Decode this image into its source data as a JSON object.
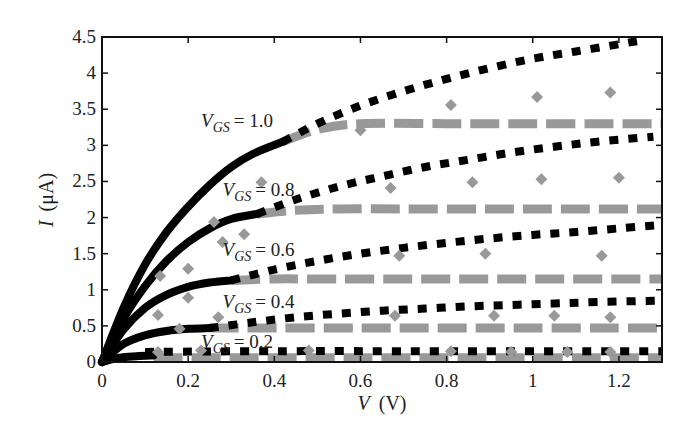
{
  "chart_data": {
    "type": "line",
    "title": "",
    "xlabel": "V (V)",
    "ylabel": "I (μA)",
    "xlim": [
      0,
      1.3
    ],
    "ylim": [
      0,
      4.5
    ],
    "xticks": [
      "0",
      "0.2",
      "0.4",
      "0.6",
      "0.8",
      "1",
      "1.2"
    ],
    "xtick_values": [
      0,
      0.2,
      0.4,
      0.6,
      0.8,
      1.0,
      1.2
    ],
    "yticks": [
      "0",
      "0.5",
      "1",
      "1.5",
      "2",
      "2.5",
      "3",
      "3.5",
      "4",
      "4.5"
    ],
    "ytick_values": [
      0,
      0.5,
      1,
      1.5,
      2,
      2.5,
      3,
      3.5,
      4,
      4.5
    ],
    "grid": false,
    "legend": "none (inline curve labels)",
    "series_styles": {
      "solid": {
        "color": "#000000",
        "description": "solid black line (linear/triode region)"
      },
      "dashed": {
        "color": "#999999",
        "description": "gray dashed line (saturation model)"
      },
      "dotted": {
        "color": "#000000",
        "description": "black square-dotted line (alternate model)"
      },
      "markers": {
        "color": "#999999",
        "description": "gray diamond markers (measured data)"
      }
    },
    "curves": [
      {
        "label_prefix": "V",
        "label_sub": "GS",
        "label_value": "= 1.0",
        "vgs": 1.0,
        "solid": {
          "x": [
            0,
            0.05,
            0.1,
            0.15,
            0.2,
            0.25,
            0.3,
            0.35,
            0.42
          ],
          "y": [
            0,
            0.75,
            1.35,
            1.8,
            2.15,
            2.45,
            2.7,
            2.88,
            3.05
          ]
        },
        "gray": {
          "x": [
            0.42,
            0.5,
            0.6,
            0.8,
            1.0,
            1.2,
            1.3
          ],
          "y": [
            3.05,
            3.22,
            3.3,
            3.3,
            3.3,
            3.3,
            3.3
          ]
        },
        "dotted": {
          "x": [
            0.42,
            0.5,
            0.6,
            0.7,
            0.8,
            0.9,
            1.0,
            1.1,
            1.2,
            1.25
          ],
          "y": [
            3.05,
            3.3,
            3.55,
            3.75,
            3.92,
            4.07,
            4.2,
            4.3,
            4.4,
            4.45
          ]
        },
        "markers": {
          "x": [
            0.6,
            0.81,
            1.01,
            1.18
          ],
          "y": [
            3.21,
            3.56,
            3.67,
            3.73
          ]
        }
      },
      {
        "label_prefix": "V",
        "label_sub": "GS",
        "label_value": "= 0.8",
        "vgs": 0.8,
        "solid": {
          "x": [
            0,
            0.05,
            0.1,
            0.15,
            0.2,
            0.25,
            0.3,
            0.36
          ],
          "y": [
            0,
            0.6,
            1.05,
            1.4,
            1.66,
            1.85,
            1.98,
            2.05
          ]
        },
        "gray": {
          "x": [
            0.36,
            0.45,
            0.55,
            0.7,
            0.9,
            1.1,
            1.3
          ],
          "y": [
            2.05,
            2.1,
            2.12,
            2.12,
            2.12,
            2.12,
            2.12
          ]
        },
        "dotted": {
          "x": [
            0.36,
            0.45,
            0.55,
            0.65,
            0.75,
            0.85,
            0.95,
            1.05,
            1.15,
            1.28
          ],
          "y": [
            2.05,
            2.25,
            2.43,
            2.57,
            2.7,
            2.8,
            2.9,
            2.98,
            3.05,
            3.12
          ]
        },
        "markers": {
          "x": [
            0.26,
            0.33,
            0.37,
            0.67,
            0.86,
            1.02,
            1.2
          ],
          "y": [
            1.94,
            1.77,
            2.49,
            2.41,
            2.49,
            2.53,
            2.55
          ]
        }
      },
      {
        "label_prefix": "V",
        "label_sub": "GS",
        "label_value": "= 0.6",
        "vgs": 0.6,
        "solid": {
          "x": [
            0,
            0.05,
            0.1,
            0.15,
            0.2,
            0.25,
            0.3
          ],
          "y": [
            0,
            0.45,
            0.75,
            0.93,
            1.04,
            1.1,
            1.13
          ]
        },
        "gray": {
          "x": [
            0.3,
            0.4,
            0.5,
            0.7,
            0.9,
            1.1,
            1.3
          ],
          "y": [
            1.13,
            1.15,
            1.15,
            1.15,
            1.15,
            1.15,
            1.15
          ]
        },
        "dotted": {
          "x": [
            0.3,
            0.4,
            0.5,
            0.6,
            0.7,
            0.8,
            0.9,
            1.0,
            1.1,
            1.2,
            1.3
          ],
          "y": [
            1.13,
            1.28,
            1.4,
            1.5,
            1.58,
            1.65,
            1.71,
            1.76,
            1.8,
            1.85,
            1.9
          ]
        },
        "markers": {
          "x": [
            0.135,
            0.2,
            0.28,
            0.69,
            0.89,
            1.16
          ],
          "y": [
            1.19,
            1.29,
            1.66,
            1.47,
            1.5,
            1.47
          ]
        }
      },
      {
        "label_prefix": "V",
        "label_sub": "GS",
        "label_value": "= 0.4",
        "vgs": 0.4,
        "solid": {
          "x": [
            0,
            0.05,
            0.1,
            0.15,
            0.2,
            0.25
          ],
          "y": [
            0,
            0.25,
            0.37,
            0.43,
            0.46,
            0.47
          ]
        },
        "gray": {
          "x": [
            0.25,
            0.4,
            0.6,
            0.8,
            1.0,
            1.2,
            1.3
          ],
          "y": [
            0.47,
            0.47,
            0.47,
            0.47,
            0.47,
            0.47,
            0.47
          ]
        },
        "dotted": {
          "x": [
            0.25,
            0.35,
            0.45,
            0.55,
            0.65,
            0.75,
            0.85,
            0.95,
            1.05,
            1.15,
            1.3
          ],
          "y": [
            0.47,
            0.55,
            0.62,
            0.67,
            0.71,
            0.74,
            0.77,
            0.79,
            0.81,
            0.83,
            0.85
          ]
        },
        "markers": {
          "x": [
            0.13,
            0.18,
            0.2,
            0.27,
            0.68,
            0.91,
            1.05,
            1.18
          ],
          "y": [
            0.65,
            0.46,
            0.89,
            0.62,
            0.64,
            0.64,
            0.64,
            0.62
          ]
        }
      },
      {
        "label_prefix": "V",
        "label_sub": "GS",
        "label_value": "= 0.2",
        "vgs": 0.2,
        "solid": {
          "x": [
            0,
            0.04,
            0.08,
            0.12
          ],
          "y": [
            0,
            0.06,
            0.08,
            0.09
          ]
        },
        "gray": {
          "x": [
            0.12,
            0.4,
            0.8,
            1.3
          ],
          "y": [
            0.06,
            0.06,
            0.06,
            0.06
          ]
        },
        "dotted": {
          "x": [
            0.1,
            0.4,
            0.8,
            1.3
          ],
          "y": [
            0.14,
            0.15,
            0.15,
            0.15
          ]
        },
        "markers": {
          "x": [
            0.13,
            0.23,
            0.48,
            0.81,
            0.95,
            1.08,
            1.18
          ],
          "y": [
            0.14,
            0.16,
            0.16,
            0.15,
            0.14,
            0.14,
            0.14
          ]
        }
      }
    ],
    "label_positions": [
      {
        "vgs": 1.0,
        "x": 0.23,
        "y": 3.25
      },
      {
        "vgs": 0.8,
        "x": 0.28,
        "y": 2.3
      },
      {
        "vgs": 0.6,
        "x": 0.28,
        "y": 1.47
      },
      {
        "vgs": 0.4,
        "x": 0.28,
        "y": 0.75
      },
      {
        "vgs": 0.2,
        "x": 0.23,
        "y": 0.2
      }
    ]
  },
  "axes": {
    "xlabel_italic": "V",
    "xlabel_unit": "(V)",
    "ylabel_italic": "I",
    "ylabel_unit": "(μA)"
  }
}
